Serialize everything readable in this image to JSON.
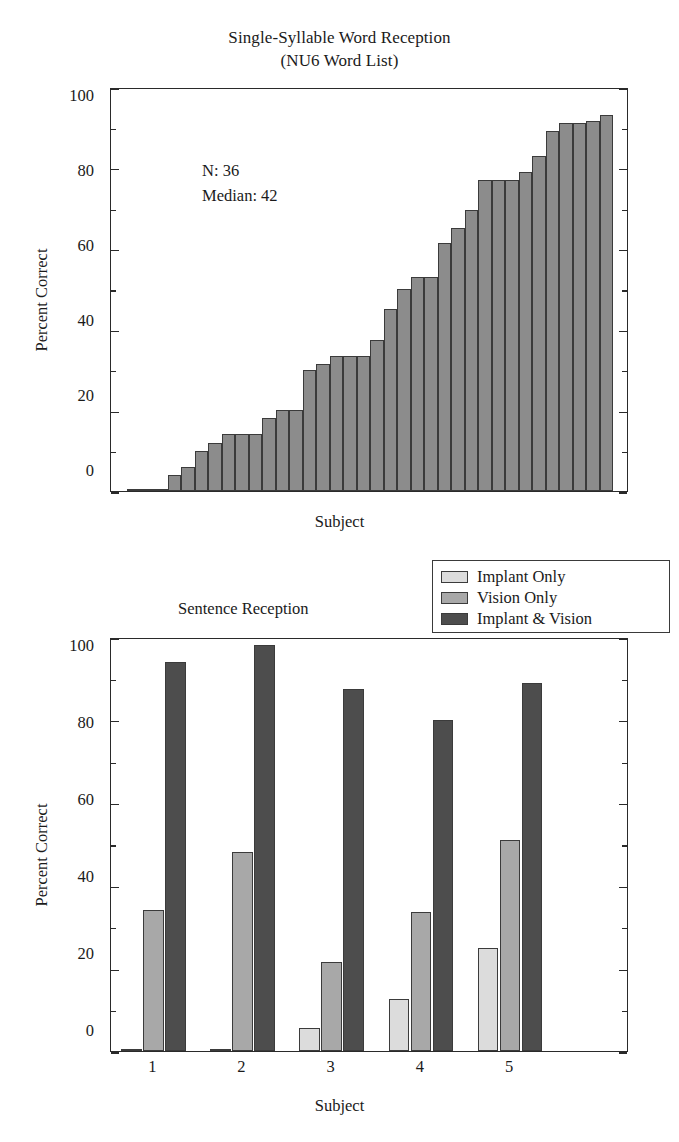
{
  "chart_data": [
    {
      "id": "word-reception",
      "type": "bar",
      "title": "Single-Syllable Word Reception",
      "subtitle": "(NU6 Word List)",
      "xlabel": "Subject",
      "ylabel": "Percent Correct",
      "ylim": [
        0,
        100
      ],
      "yticks": [
        0,
        20,
        40,
        60,
        80,
        100
      ],
      "ytick_labels": [
        "0",
        "20",
        "40",
        "60",
        "80",
        "100"
      ],
      "minor_ticks": [
        10,
        30,
        50,
        70,
        90
      ],
      "grid": false,
      "legend": null,
      "annotations": [
        "N: 36",
        "Median: 42"
      ],
      "n": 36,
      "median": 42,
      "bar_color": "#8c8c8c",
      "categories": [
        "1",
        "2",
        "3",
        "4",
        "5",
        "6",
        "7",
        "8",
        "9",
        "10",
        "11",
        "12",
        "13",
        "14",
        "15",
        "16",
        "17",
        "18",
        "19",
        "20",
        "21",
        "22",
        "23",
        "24",
        "25",
        "26",
        "27",
        "28",
        "29",
        "30",
        "31",
        "32",
        "33",
        "34",
        "35",
        "36"
      ],
      "values": [
        0,
        0,
        0,
        4,
        6,
        10,
        12,
        14,
        14,
        14,
        18,
        20,
        20,
        30,
        31.5,
        33.5,
        33.5,
        33.5,
        37.5,
        45,
        50,
        53,
        53,
        61.5,
        65,
        69.5,
        77,
        77,
        77,
        79,
        83,
        89,
        91,
        91,
        91.5,
        93
      ]
    },
    {
      "id": "sentence-reception",
      "type": "bar",
      "title": "Sentence Reception",
      "xlabel": "Subject",
      "ylabel": "Percent Correct",
      "ylim": [
        0,
        100
      ],
      "yticks": [
        0,
        20,
        40,
        60,
        80,
        100
      ],
      "ytick_labels": [
        "0",
        "20",
        "40",
        "60",
        "80",
        "100"
      ],
      "minor_ticks": [
        10,
        30,
        50,
        70,
        90
      ],
      "grid": false,
      "legend_position": "top-right",
      "categories": [
        "1",
        "2",
        "3",
        "4",
        "5"
      ],
      "series": [
        {
          "name": "Implant Only",
          "color": "#dcdcdc",
          "values": [
            0,
            0,
            5.5,
            12.5,
            25
          ]
        },
        {
          "name": "Vision Only",
          "color": "#a8a8a8",
          "values": [
            34,
            48,
            21.5,
            33.5,
            51
          ]
        },
        {
          "name": "Implant & Vision",
          "color": "#4d4d4d",
          "values": [
            94,
            98,
            87.5,
            80,
            89
          ]
        }
      ]
    }
  ]
}
